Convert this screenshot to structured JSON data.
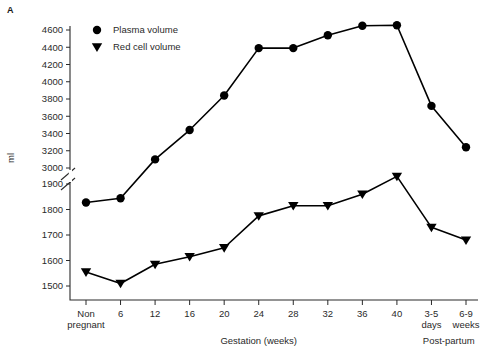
{
  "panel": {
    "letter": "A"
  },
  "chart_data": {
    "type": "line",
    "title": "",
    "xlabel": "Gestation (weeks)",
    "ylabel": "ml",
    "grid": false,
    "legend_position": "top-left inside plot",
    "categories": [
      "Non pregnant",
      "6",
      "12",
      "16",
      "20",
      "24",
      "28",
      "32",
      "36",
      "40",
      "3-5 days",
      "6-9 weeks"
    ],
    "category_sublabels": [
      "",
      "",
      "",
      "",
      "",
      "",
      "",
      "",
      "",
      "",
      "days",
      "weeks"
    ],
    "category_primary": [
      "Non",
      "6",
      "12",
      "16",
      "20",
      "24",
      "28",
      "32",
      "36",
      "40",
      "3-5",
      "6-9"
    ],
    "category_secondary": [
      "pregnant",
      "",
      "",
      "",
      "",
      "",
      "",
      "",
      "",
      "",
      "days",
      "weeks"
    ],
    "group_labels": [
      {
        "text": "Gestation (weeks)",
        "spans": "6 to 40"
      },
      {
        "text": "Post-partum",
        "spans": "3-5 days to 6-9 weeks"
      }
    ],
    "axis_break": true,
    "axis_break_note": "y-axis broken between 3000 and 1900",
    "y_upper_ticks": [
      3000,
      3200,
      3400,
      3600,
      3800,
      4000,
      4200,
      4400,
      4600
    ],
    "y_lower_ticks": [
      1500,
      1600,
      1700,
      1800,
      1900
    ],
    "ylim_upper": [
      2900,
      4700
    ],
    "ylim_lower": [
      1440,
      1960
    ],
    "series": [
      {
        "name": "Plasma volume",
        "marker": "circle",
        "values": [
          2600,
          2650,
          3100,
          3440,
          3840,
          4390,
          4390,
          4540,
          4650,
          4655,
          3720,
          3240
        ]
      },
      {
        "name": "Red cell volume",
        "marker": "triangle-down",
        "values": [
          1555,
          1510,
          1585,
          1615,
          1650,
          1775,
          1815,
          1815,
          1860,
          1930,
          1730,
          1680
        ]
      }
    ]
  },
  "legend": {
    "entries": [
      {
        "label": "Plasma volume",
        "marker": "circle"
      },
      {
        "label": "Red cell volume",
        "marker": "triangle-down"
      }
    ]
  },
  "colors": {
    "ink": "#000000",
    "text": "#2a2a2a",
    "background": "#ffffff"
  }
}
